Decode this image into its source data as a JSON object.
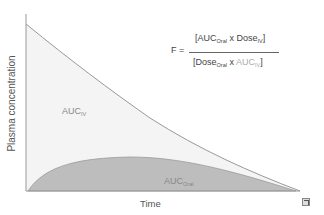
{
  "diagram": {
    "y_axis_label": "Plasma concentration",
    "x_axis_label": "Time",
    "region_iv": {
      "label": "AUC",
      "subscript": "IV"
    },
    "region_oral": {
      "label": "AUC",
      "subscript": "Oral"
    },
    "formula": {
      "lhs": "F =",
      "numerator": {
        "open": "[AUC",
        "sub1": "Oral",
        "mid": " x Dose",
        "sub2": "IV",
        "close": "]"
      },
      "denominator": {
        "open": "[Dose",
        "sub1": "Oral",
        "mid": " x ",
        "term2": "AUC",
        "sub2": "IV",
        "close": "]"
      }
    },
    "colors": {
      "iv_fill": "#f4f4f4",
      "iv_line": "#999999",
      "oral_fill": "#bdbdbd",
      "oral_line": "#9a9a9a",
      "axis": "#999999"
    },
    "icon": "expand-icon"
  }
}
